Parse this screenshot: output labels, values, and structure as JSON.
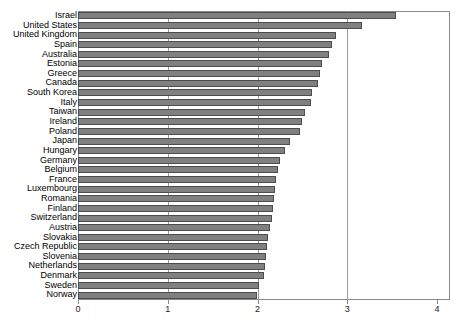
{
  "chart_data": {
    "type": "bar",
    "orientation": "horizontal",
    "title": "",
    "subtitle": "",
    "xlabel": "",
    "ylabel": "",
    "xlim": [
      0,
      4
    ],
    "xticks": [
      0,
      1,
      2,
      3,
      4
    ],
    "xtick_labels": [
      "0",
      "1",
      "2",
      "3",
      "4"
    ],
    "grid": "vertical",
    "legend": "none",
    "bar_color": "#808080",
    "bar_edge_color": "#4d4d4d",
    "frame_color": "#8a8a8a",
    "categories": [
      "Israel",
      "United States",
      "United Kingdom",
      "Spain",
      "Australia",
      "Estonia",
      "Greece",
      "Canada",
      "South Korea",
      "Italy",
      "Taiwan",
      "Ireland",
      "Poland",
      "Japan",
      "Hungary",
      "Germany",
      "Belgium",
      "France",
      "Luxembourg",
      "Romania",
      "Finland",
      "Switzerland",
      "Austria",
      "Slovakia",
      "Czech Republic",
      "Slovenia",
      "Netherlands",
      "Denmark",
      "Sweden",
      "Norway"
    ],
    "values": [
      3.54,
      3.16,
      2.87,
      2.83,
      2.8,
      2.72,
      2.7,
      2.67,
      2.61,
      2.6,
      2.53,
      2.5,
      2.47,
      2.36,
      2.31,
      2.25,
      2.23,
      2.21,
      2.19,
      2.18,
      2.17,
      2.16,
      2.14,
      2.12,
      2.11,
      2.09,
      2.08,
      2.07,
      2.02,
      1.99
    ]
  }
}
